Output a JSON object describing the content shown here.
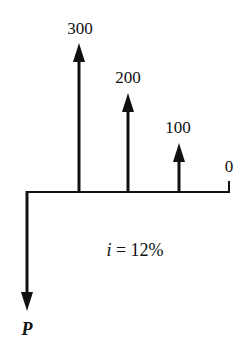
{
  "diagram": {
    "type": "cash-flow-diagram",
    "timeline": {
      "periods": 4
    },
    "cash_flows": [
      {
        "period": 1,
        "label": "300",
        "direction": "up"
      },
      {
        "period": 2,
        "label": "200",
        "direction": "up"
      },
      {
        "period": 3,
        "label": "100",
        "direction": "up"
      },
      {
        "period": 4,
        "label": "0",
        "direction": "none"
      }
    ],
    "present_value": {
      "label": "P",
      "direction": "down"
    },
    "interest": {
      "symbol": "i",
      "equals": "= 12%"
    }
  }
}
